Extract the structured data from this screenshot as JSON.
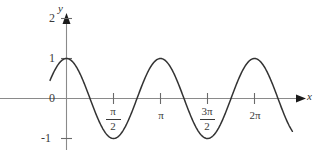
{
  "chart_data": {
    "type": "line",
    "title": "",
    "subtitle": "",
    "xlabel": "x",
    "ylabel": "y",
    "function": "y = cos(2x)",
    "grid": false,
    "legend": false,
    "xlim": [
      -0.55,
      7.55
    ],
    "ylim": [
      -1.45,
      2.25
    ],
    "x_tick_values": [
      1.5708,
      3.14159,
      4.71239,
      6.28319
    ],
    "x_tick_labels": [
      "π/2",
      "π",
      "3π/2",
      "2π"
    ],
    "y_tick_values": [
      -1,
      0,
      1,
      2
    ],
    "y_tick_labels": [
      "-1",
      "0",
      "1",
      "2"
    ],
    "series": [
      {
        "name": "cos(2x)",
        "color": "#333333",
        "x": [
          -0.55,
          -0.45,
          -0.35,
          -0.25,
          -0.15,
          -0.05,
          0.0,
          0.05,
          0.15,
          0.25,
          0.35,
          0.45,
          0.55,
          0.65,
          0.75,
          0.85,
          0.95,
          1.05,
          1.15,
          1.25,
          1.35,
          1.45,
          1.5708,
          1.65,
          1.75,
          1.85,
          1.95,
          2.05,
          2.15,
          2.25,
          2.35,
          2.45,
          2.55,
          2.65,
          2.75,
          2.85,
          2.95,
          3.05,
          3.14159,
          3.25,
          3.35,
          3.45,
          3.55,
          3.65,
          3.75,
          3.85,
          3.95,
          4.05,
          4.15,
          4.25,
          4.35,
          4.45,
          4.55,
          4.65,
          4.71239,
          4.85,
          4.95,
          5.05,
          5.15,
          5.25,
          5.35,
          5.45,
          5.55,
          5.65,
          5.75,
          5.85,
          5.95,
          6.05,
          6.15,
          6.28319,
          6.45,
          6.55,
          6.65,
          6.75,
          6.85,
          6.95,
          7.05,
          7.15,
          7.25,
          7.35,
          7.45,
          7.55
        ],
        "y": [
          -0.459,
          -0.621,
          -0.765,
          -0.878,
          -0.956,
          -0.995,
          -1.0,
          -0.995,
          -0.956,
          -0.878,
          -0.765,
          -0.621,
          -0.459,
          -0.283,
          -0.073,
          0.128,
          0.329,
          0.512,
          0.675,
          0.808,
          0.908,
          0.97,
          1.0,
          0.985,
          0.936,
          0.856,
          0.748,
          0.614,
          0.46,
          0.291,
          0.111,
          -0.073,
          -0.256,
          -0.43,
          -0.591,
          -0.733,
          -0.85,
          -0.936,
          -1.0,
          -0.976,
          -0.916,
          -0.825,
          -0.705,
          -0.562,
          -0.402,
          -0.23,
          -0.053,
          0.128,
          0.302,
          0.466,
          0.616,
          0.748,
          0.856,
          0.939,
          1.0,
          0.974,
          0.921,
          0.841,
          0.736,
          0.608,
          0.46,
          0.298,
          0.128,
          -0.045,
          -0.216,
          -0.38,
          -0.534,
          -0.67,
          -0.786,
          -1.0,
          -0.954,
          -0.886,
          -0.793,
          -0.675,
          -0.536,
          -0.38,
          -0.212,
          -0.038,
          0.137,
          0.307,
          0.466,
          0.608
        ]
      }
    ],
    "annotations": {
      "y_axis_arrow": true,
      "x_axis_arrow": true,
      "axis_label_x": "x",
      "axis_label_y": "y"
    }
  },
  "axes": {
    "y_ticks": [
      {
        "label": "2"
      },
      {
        "label": "1"
      },
      {
        "label": "0"
      },
      {
        "label": "-1"
      }
    ],
    "x_ticks": [
      {
        "label": "π/2",
        "numerator": "π",
        "denominator": "2",
        "is_fraction": true
      },
      {
        "label": "π",
        "numerator": "",
        "denominator": "",
        "is_fraction": false
      },
      {
        "label": "3π/2",
        "numerator": "3π",
        "denominator": "2",
        "is_fraction": true
      },
      {
        "label": "2π",
        "numerator": "",
        "denominator": "",
        "is_fraction": false
      }
    ],
    "x_axis_name": "x",
    "y_axis_name": "y"
  },
  "style": {
    "curve_color": "#333333",
    "axis_color": "#8a8a8a",
    "tick_color": "#6a6a6a",
    "text_color": "#3a3a3a",
    "background": "#ffffff"
  }
}
